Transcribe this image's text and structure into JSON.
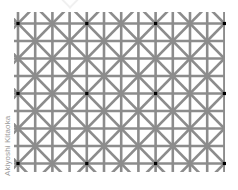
{
  "illusion": {
    "name": "Twelve dots illusion",
    "credit": "Akiyoshi Kitaoka",
    "background": "#ffffff",
    "line_color": "#8c8c8c",
    "line_width": 2.6,
    "dot_color": "#000000",
    "dot_size": 3.2,
    "grid": {
      "origin_x": 18,
      "origin_y": 23.5,
      "cell_w": 17.2,
      "cell_h": 17.5,
      "cols": 12,
      "rows": 8,
      "clip": {
        "left": 14,
        "top": 12,
        "right": 225,
        "bottom": 172
      }
    },
    "dots": [
      {
        "col": 0,
        "row": 0
      },
      {
        "col": 4,
        "row": 0
      },
      {
        "col": 8,
        "row": 0
      },
      {
        "col": 12,
        "row": 0
      },
      {
        "col": 0,
        "row": 4
      },
      {
        "col": 4,
        "row": 4
      },
      {
        "col": 8,
        "row": 4
      },
      {
        "col": 12,
        "row": 4
      },
      {
        "col": 0,
        "row": 8
      },
      {
        "col": 4,
        "row": 8
      },
      {
        "col": 8,
        "row": 8
      },
      {
        "col": 12,
        "row": 8
      }
    ]
  }
}
